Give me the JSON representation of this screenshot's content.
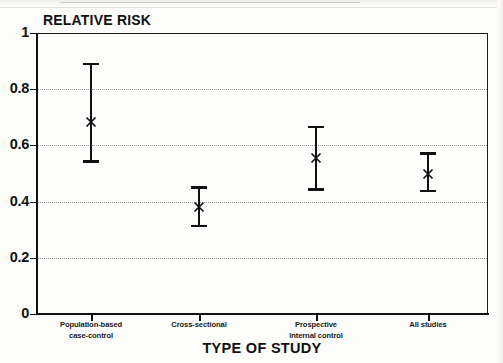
{
  "chart_data": {
    "type": "scatter",
    "title": "",
    "ylabel": "RELATIVE RISK",
    "xlabel": "TYPE OF STUDY",
    "ylim": [
      0,
      1
    ],
    "yticks": [
      "0",
      "0.2",
      "0.4",
      "0.6",
      "0.8",
      "1"
    ],
    "ytick_values": [
      0,
      0.2,
      0.4,
      0.6,
      0.8,
      1
    ],
    "grid": "horizontal dotted gridlines at 0.2, 0.4, 0.6, 0.8",
    "legend": "none",
    "marker": "x",
    "error_style": "capped vertical error bars (95% confidence interval)",
    "categories": [
      "Population-based case-control",
      "Cross-sectional",
      "Prospective internal control",
      "All studies"
    ],
    "category_lines": [
      [
        "Population-based",
        "case-control"
      ],
      [
        "Cross-sectional"
      ],
      [
        "Prospective",
        "internal control"
      ],
      [
        "All studies"
      ]
    ],
    "values": [
      0.685,
      0.38,
      0.555,
      0.5
    ],
    "ci_low": [
      0.54,
      0.31,
      0.44,
      0.435
    ],
    "ci_high": [
      0.895,
      0.455,
      0.67,
      0.575
    ],
    "points": [
      {
        "category": "Population-based case-control",
        "value": 0.685,
        "low": 0.54,
        "high": 0.895
      },
      {
        "category": "Cross-sectional",
        "value": 0.38,
        "low": 0.31,
        "high": 0.455
      },
      {
        "category": "Prospective internal control",
        "value": 0.555,
        "low": 0.44,
        "high": 0.67
      },
      {
        "category": "All studies",
        "value": 0.5,
        "low": 0.435,
        "high": 0.575
      }
    ],
    "colors": {
      "axis": "#111111",
      "grid": "#9a9a9a",
      "marker": "#111111",
      "background": "#fdfdfb"
    }
  }
}
